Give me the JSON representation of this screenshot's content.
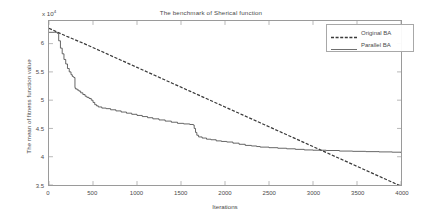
{
  "chart_data": {
    "type": "line",
    "title": "The benchmark of Sherical function",
    "xlabel": "Iterations",
    "ylabel": "The mean of fitness function value",
    "y_multiplier_text": "x 10",
    "y_multiplier_exponent": "4",
    "y_scale": 10000,
    "xlim": [
      0,
      4000
    ],
    "ylim": [
      3.5,
      6.4
    ],
    "xticks": [
      0,
      500,
      1000,
      1500,
      2000,
      2500,
      3000,
      3500,
      4000
    ],
    "xtick_labels": [
      "0",
      "500",
      "1000",
      "1500",
      "2000",
      "2500",
      "3000",
      "3500",
      "4000"
    ],
    "yticks": [
      3.5,
      4,
      4.5,
      5,
      5.5,
      6
    ],
    "ytick_labels": [
      "3.5",
      "4",
      "4.5",
      "5",
      "5.5",
      "6"
    ],
    "grid": false,
    "legend_position": "top-right",
    "series": [
      {
        "name": "Original BA",
        "style": "dashed",
        "color": "#3a3a3a",
        "x": [
          0,
          200,
          400,
          600,
          800,
          1000,
          1200,
          1400,
          1600,
          1800,
          2000,
          2200,
          2400,
          2600,
          2800,
          3000,
          3200,
          3400,
          3600,
          3800,
          4000
        ],
        "y": [
          6.27,
          6.13,
          6.0,
          5.86,
          5.72,
          5.58,
          5.44,
          5.3,
          5.16,
          5.02,
          4.88,
          4.74,
          4.6,
          4.46,
          4.32,
          4.18,
          4.04,
          3.9,
          3.76,
          3.62,
          3.48
        ]
      },
      {
        "name": "Parallel BA",
        "style": "solid",
        "color": "#4a4a4a",
        "x": [
          0,
          60,
          95,
          110,
          130,
          150,
          170,
          190,
          210,
          230,
          250,
          265,
          275,
          285,
          295,
          300,
          320,
          340,
          360,
          385,
          410,
          430,
          455,
          480,
          500,
          520,
          540,
          560,
          600,
          650,
          700,
          760,
          820,
          880,
          940,
          1000,
          1060,
          1120,
          1180,
          1250,
          1320,
          1390,
          1460,
          1530,
          1600,
          1640,
          1650,
          1665,
          1680,
          1700,
          1740,
          1790,
          1840,
          1900,
          1960,
          2020,
          2090,
          2160,
          2230,
          2300,
          2360,
          2400,
          2500,
          2600,
          2700,
          2800,
          2900,
          3000,
          3150,
          3300,
          3450,
          3600,
          3750,
          3900,
          4000
        ],
        "y": [
          6.2,
          6.2,
          6.18,
          6.05,
          5.92,
          5.82,
          5.72,
          5.64,
          5.56,
          5.5,
          5.45,
          5.42,
          5.41,
          5.4,
          5.22,
          5.2,
          5.18,
          5.16,
          5.13,
          5.1,
          5.07,
          5.05,
          5.03,
          5.0,
          4.96,
          4.92,
          4.9,
          4.88,
          4.86,
          4.85,
          4.83,
          4.81,
          4.79,
          4.77,
          4.75,
          4.73,
          4.71,
          4.69,
          4.67,
          4.65,
          4.63,
          4.61,
          4.59,
          4.58,
          4.57,
          4.56,
          4.5,
          4.43,
          4.38,
          4.35,
          4.33,
          4.31,
          4.3,
          4.28,
          4.27,
          4.26,
          4.24,
          4.22,
          4.2,
          4.19,
          4.18,
          4.17,
          4.16,
          4.15,
          4.14,
          4.13,
          4.12,
          4.115,
          4.11,
          4.1,
          4.095,
          4.09,
          4.085,
          4.08,
          4.07
        ]
      }
    ],
    "crossing_point": {
      "x": 2980,
      "y": 4.12
    }
  },
  "legend": {
    "items": [
      {
        "label": "Original BA",
        "style": "dashed"
      },
      {
        "label": "Parallel BA",
        "style": "solid"
      }
    ]
  }
}
